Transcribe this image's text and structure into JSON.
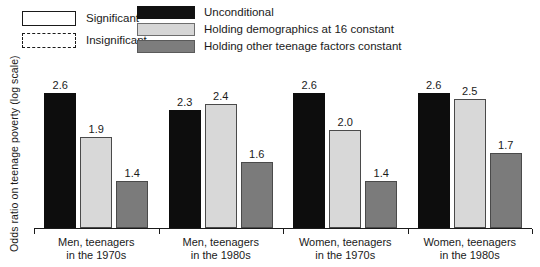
{
  "chart_data": {
    "type": "bar",
    "title": "",
    "xlabel": "",
    "ylabel": "Odds ratio on teenage poverty (log scale)",
    "ylim": [
      1.0,
      2.8
    ],
    "grid": false,
    "legend_position": "top",
    "categories": [
      "Men, teenagers\nin the 1970s",
      "Men, teenagers\nin the 1980s",
      "Women, teenagers\nin the 1970s",
      "Women, teenagers\nin the 1980s"
    ],
    "series": [
      {
        "name": "Unconditional",
        "values": [
          2.6,
          2.3,
          2.6,
          2.6
        ]
      },
      {
        "name": "Holding demographics at 16 constant",
        "values": [
          1.9,
          2.4,
          2.0,
          2.5
        ]
      },
      {
        "name": "Holding other teenage factors constant",
        "values": [
          1.4,
          1.6,
          1.4,
          1.7
        ]
      }
    ]
  },
  "legend": {
    "significance": [
      {
        "label": "Significant",
        "style": "solid"
      },
      {
        "label": "Insignificant",
        "style": "dashed"
      }
    ],
    "series": [
      {
        "label": "Unconditional",
        "color": "#111111"
      },
      {
        "label": "Holding demographics at 16 constant",
        "color": "#d6d6d6"
      },
      {
        "label": "Holding other teenage factors constant",
        "color": "#7d7d7d"
      }
    ]
  },
  "axis": {
    "ylabel": "Odds ratio on teenage poverty (log scale)"
  },
  "groups": [
    {
      "line1": "Men, teenagers",
      "line2": "in the 1970s",
      "bars": [
        {
          "value": "2.6",
          "num": 2.6,
          "fill": "black",
          "significant": true
        },
        {
          "value": "1.9",
          "num": 1.9,
          "fill": "light",
          "significant": true
        },
        {
          "value": "1.4",
          "num": 1.4,
          "fill": "mid",
          "significant": true
        }
      ]
    },
    {
      "line1": "Men, teenagers",
      "line2": "in the 1980s",
      "bars": [
        {
          "value": "2.3",
          "num": 2.3,
          "fill": "black",
          "significant": true
        },
        {
          "value": "2.4",
          "num": 2.4,
          "fill": "light",
          "significant": true
        },
        {
          "value": "1.6",
          "num": 1.6,
          "fill": "mid",
          "significant": true
        }
      ]
    },
    {
      "line1": "Women, teenagers",
      "line2": "in the 1970s",
      "bars": [
        {
          "value": "2.6",
          "num": 2.6,
          "fill": "black",
          "significant": true
        },
        {
          "value": "2.0",
          "num": 2.0,
          "fill": "light",
          "significant": true
        },
        {
          "value": "1.4",
          "num": 1.4,
          "fill": "mid",
          "significant": true
        }
      ]
    },
    {
      "line1": "Women, teenagers",
      "line2": "in the 1980s",
      "bars": [
        {
          "value": "2.6",
          "num": 2.6,
          "fill": "black",
          "significant": true
        },
        {
          "value": "2.5",
          "num": 2.5,
          "fill": "light",
          "significant": true
        },
        {
          "value": "1.7",
          "num": 1.7,
          "fill": "mid",
          "significant": true
        }
      ]
    }
  ]
}
